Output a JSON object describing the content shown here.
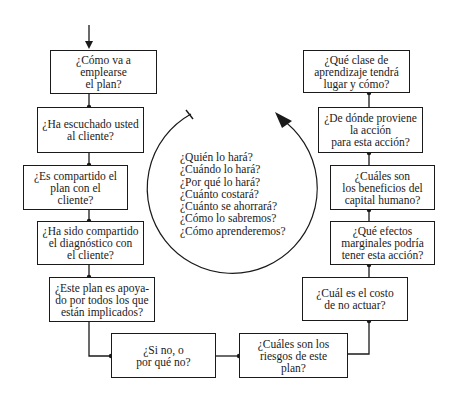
{
  "diagram": {
    "type": "flowchart-cycle",
    "left_chain": [
      {
        "id": "b1",
        "text": "¿Cómo va a emplearse\nel plan?"
      },
      {
        "id": "b2",
        "text": "¿Ha escuchado usted\nal cliente?"
      },
      {
        "id": "b3",
        "text": "¿Es compartido el\nplan con el\ncliente?"
      },
      {
        "id": "b4",
        "text": "¿Ha sido compartido\nel diagnóstico con\nel cliente?"
      },
      {
        "id": "b5",
        "text": "¿Este plan es apoya-\ndo por todos los que\nestán implicados?"
      },
      {
        "id": "b6",
        "text": "¿Si no, o\npor qué no?"
      }
    ],
    "right_chain": [
      {
        "id": "b7",
        "text": "¿Cuáles son los\nriesgos de este\nplan?"
      },
      {
        "id": "b8",
        "text": "¿Cuál es el costo\nde no actuar?"
      },
      {
        "id": "b9",
        "text": "¿Qué efectos\nmarginales podría\ntener esta acción?"
      },
      {
        "id": "b10",
        "text": "¿Cuáles son\nlos beneficios del\ncapital humano?"
      },
      {
        "id": "b11",
        "text": "¿De dónde proviene\nla acción\npara esta acción?"
      },
      {
        "id": "b12",
        "text": "¿Qué clase de\naprendizaje tendrá\nlugar y cómo?"
      }
    ],
    "center_questions": "¿Quién lo hará?\n¿Cuándo lo hará?\n¿Por qué lo hará?\n¿Cuánto costará?\n¿Cuánto se ahorrará?\n¿Cómo lo sabremos?\n¿Cómo aprenderemos?",
    "cycle_direction": "clockwise"
  }
}
